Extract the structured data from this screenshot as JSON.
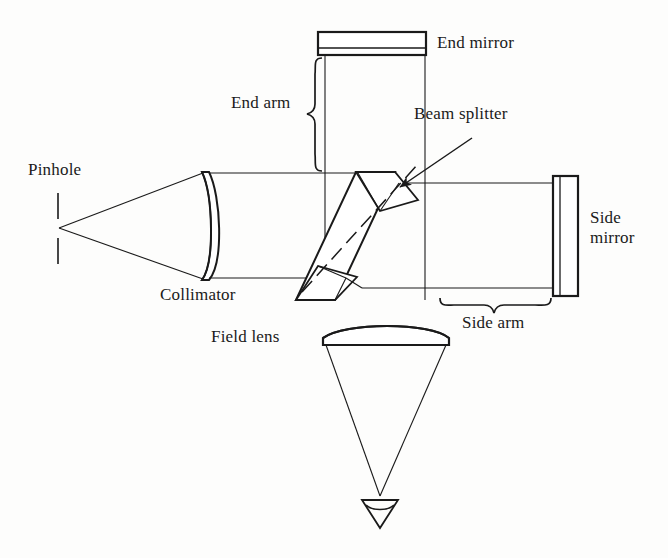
{
  "figure": {
    "type": "optical-schematic",
    "background_color": "#fdfdfc",
    "line_color": "#1a1a1a",
    "text_color": "#1a1a1a"
  },
  "labels": {
    "pinhole": "Pinhole",
    "collimator": "Collimator",
    "end_mirror": "End mirror",
    "end_arm": "End arm",
    "beam_splitter": "Beam splitter",
    "side_mirror": "Side\nmirror",
    "side_mirror_line1": "Side",
    "side_mirror_line2": "mirror",
    "side_arm": "Side arm",
    "field_lens": "Field lens"
  },
  "components": [
    {
      "name": "pinhole",
      "label": "Pinhole",
      "kind": "aperture",
      "x": 58,
      "y": 228,
      "description": "two short vertical tick marks forming a point source aperture"
    },
    {
      "name": "collimator",
      "label": "Collimator",
      "kind": "plano-convex-lens",
      "x_left": 200,
      "x_right": 222,
      "y_top": 172,
      "y_bottom": 280,
      "description": "flat left face, convex right face; collimates the diverging pinhole beam"
    },
    {
      "name": "beam-splitter",
      "label": "Beam splitter",
      "kind": "tilted-plate",
      "center_x": 378,
      "center_y": 228,
      "angle_deg": -45,
      "description": "45 degree tilted plate with dashed optical-axis centerline and cube corners"
    },
    {
      "name": "end-mirror",
      "label": "End mirror",
      "kind": "flat-mirror-horizontal",
      "x_left": 318,
      "x_right": 426,
      "y_top": 32,
      "y_bottom": 55,
      "description": "horizontal rectangle with thin reflective inner line near its lower edge"
    },
    {
      "name": "side-mirror",
      "label": "Side mirror",
      "kind": "flat-mirror-vertical",
      "x_left": 553,
      "x_right": 578,
      "y_top": 176,
      "y_bottom": 296,
      "description": "vertical rectangle with thin reflective inner line near its left edge"
    },
    {
      "name": "field-lens",
      "label": "Field lens",
      "kind": "convex-lens",
      "x_left": 323,
      "x_right": 449,
      "y_center": 340,
      "description": "convex top surface, flat bottom; forms the output cone toward the eye"
    },
    {
      "name": "eye",
      "label": "",
      "kind": "eye-symbol",
      "x": 380,
      "y": 505,
      "description": "small downward triangle denoting the observer's eye at the focus"
    }
  ],
  "braces": [
    {
      "name": "end-arm-brace",
      "label": "End arm",
      "orientation": "vertical",
      "x": 320,
      "y_top": 60,
      "y_bottom": 172
    },
    {
      "name": "side-arm-brace",
      "label": "Side arm",
      "orientation": "horizontal",
      "y": 300,
      "x_left": 440,
      "x_right": 553
    }
  ],
  "beam_paths": {
    "source_cone": "pinhole point at (58,228) diverging to collimator edges (200,172) and (200,280)",
    "collimated_beam": "parallel rays from collimator to beam splitter between y=173 and y=278",
    "end_arm_beam": "vertical parallel rays from beam splitter up to end mirror between x=325 and x=425",
    "side_arm_beam": "horizontal parallel rays from beam splitter right to side mirror between y=183 and y=288",
    "output_cone": "converging cone from field lens edges (325,345) and (447,345) to eye point (380,496)"
  },
  "annotations": [
    {
      "name": "beam-splitter-leader",
      "from_x": 470,
      "from_y": 140,
      "to_x": 398,
      "to_y": 186,
      "has_arrowhead": true
    }
  ]
}
